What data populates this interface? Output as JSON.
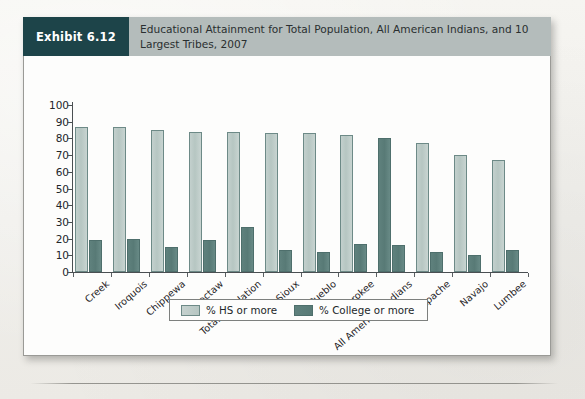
{
  "exhibit": {
    "badge": "Exhibit 6.12",
    "title": "Educational Attainment for Total Population, All American Indians, and 10 Largest Tribes, 2007"
  },
  "colors": {
    "badge_bg": "#1d4449",
    "header_bg": "#b4bcbb",
    "series_hs": "#b9c9c6",
    "series_college": "#5a7d7a",
    "axis": "#4a4f52",
    "page_bg": "#f2f1ed"
  },
  "legend": {
    "items": [
      {
        "label": "% HS or more",
        "color": "#b9c9c6"
      },
      {
        "label": "% College or more",
        "color": "#5a7d7a"
      }
    ]
  },
  "chart_data": {
    "type": "bar",
    "title": "Educational Attainment for Total Population, All American Indians, and 10 Largest Tribes, 2007",
    "xlabel": "",
    "ylabel": "",
    "ylim": [
      0,
      100
    ],
    "yticks": [
      0,
      10,
      20,
      30,
      40,
      50,
      60,
      70,
      80,
      90,
      100
    ],
    "grid": false,
    "legend_position": "bottom",
    "highlight_category": "All American Indians",
    "categories": [
      "Creek",
      "Iroquois",
      "Chippewa",
      "Choctaw",
      "Total Population",
      "Sioux",
      "Pueblo",
      "Cherokee",
      "All American Indians",
      "Apache",
      "Navajo",
      "Lumbee"
    ],
    "series": [
      {
        "name": "% HS or more",
        "color": "#b9c9c6",
        "values": [
          87,
          87,
          85,
          84,
          84,
          83,
          83,
          82,
          80,
          77,
          70,
          67
        ]
      },
      {
        "name": "% College or more",
        "color": "#5a7d7a",
        "values": [
          19,
          20,
          15,
          19,
          27,
          13,
          12,
          17,
          16,
          12,
          10,
          13
        ]
      }
    ]
  }
}
